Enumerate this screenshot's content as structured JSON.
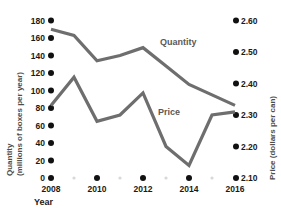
{
  "chart_data": {
    "type": "line",
    "title": "",
    "xlabel": "Year",
    "x": [
      2008,
      2009,
      2010,
      2011,
      2012,
      2013,
      2014,
      2015,
      2016
    ],
    "xticks": [
      "2008",
      "2010",
      "2012",
      "2014",
      "2016"
    ],
    "xtick_values": [
      2008,
      2010,
      2012,
      2014,
      2016
    ],
    "xlim": [
      2008,
      2016
    ],
    "grid": false,
    "legend_position": "inline-labels",
    "series": [
      {
        "name": "Quantity",
        "axis": "left",
        "values": [
          170,
          163,
          134,
          140,
          149,
          128,
          107,
          95,
          83
        ],
        "color": "#6e6e6e"
      },
      {
        "name": "Price",
        "axis": "right",
        "values": [
          2.33,
          2.42,
          2.28,
          2.3,
          2.37,
          2.2,
          2.14,
          2.3,
          2.31
        ],
        "color": "#6e6e6e"
      }
    ],
    "left_axis": {
      "label_line1": "Quantity",
      "label_line2": "(millions of boxes per year)",
      "ylim": [
        0,
        180
      ],
      "ticks": [
        180,
        160,
        140,
        120,
        100,
        80,
        60,
        40,
        20,
        0
      ],
      "tick_labels": [
        "180",
        "160",
        "140",
        "120",
        "100",
        "80",
        "60",
        "40",
        "20",
        "0"
      ]
    },
    "right_axis": {
      "label": "Price (dollars per can)",
      "ylim": [
        2.1,
        2.6
      ],
      "ticks": [
        2.6,
        2.5,
        2.4,
        2.3,
        2.2,
        2.1
      ],
      "tick_labels": [
        "2.60",
        "2.50",
        "2.40",
        "2.30",
        "2.20",
        "2.10"
      ]
    },
    "annotations": [
      {
        "text": "Quantity",
        "x": 2012.6,
        "y": 145
      },
      {
        "text": "Price",
        "x": 2012.5,
        "y": 78
      }
    ]
  },
  "labels": {
    "y_left_line1": "Quantity",
    "y_left_line2": "(millions of boxes per year)",
    "y_right": "Price (dollars per can)",
    "x_axis_title": "Year",
    "series_quantity": "Quantity",
    "series_price": "Price",
    "left_tick_180": "180",
    "left_tick_160": "160",
    "left_tick_140": "140",
    "left_tick_120": "120",
    "left_tick_100": "100",
    "left_tick_80": "80",
    "left_tick_60": "60",
    "left_tick_40": "40",
    "left_tick_20": "20",
    "left_tick_0": "0",
    "right_tick_260": "2.60",
    "right_tick_250": "2.50",
    "right_tick_240": "2.40",
    "right_tick_230": "2.30",
    "right_tick_220": "2.20",
    "right_tick_210": "2.10",
    "x_tick_2008": "2008",
    "x_tick_2010": "2010",
    "x_tick_2012": "2012",
    "x_tick_2014": "2014",
    "x_tick_2016": "2016"
  },
  "colors": {
    "line": "#6e6e6e",
    "text": "#1a1a1a",
    "muted_text": "#595959",
    "dot": "#111111",
    "minor_dot": "#d8d8d8",
    "background": "#ffffff"
  }
}
